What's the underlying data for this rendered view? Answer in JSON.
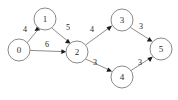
{
  "figure": {
    "type": "directed-weighted-graph",
    "background_color": "#ffffff",
    "node_fill_color": "#ffffff",
    "node_stroke_color": "#8a8a8a",
    "edge_color": "#8d8d8d",
    "arrow_color": "#1a1a1a",
    "label_color": "#2b2b2b"
  },
  "graph": {
    "nodes": [
      {
        "id": "0",
        "label": "0",
        "cx": 19,
        "cy": 50,
        "r": 11
      },
      {
        "id": "1",
        "label": "1",
        "cx": 45,
        "cy": 19,
        "r": 11
      },
      {
        "id": "2",
        "label": "2",
        "cx": 77,
        "cy": 52,
        "r": 11
      },
      {
        "id": "3",
        "label": "3",
        "cx": 122,
        "cy": 20,
        "r": 11
      },
      {
        "id": "4",
        "label": "4",
        "cx": 122,
        "cy": 77,
        "r": 11
      },
      {
        "id": "5",
        "label": "5",
        "cx": 161,
        "cy": 49,
        "r": 11
      }
    ],
    "edges": [
      {
        "id": "e0-1",
        "from": "0",
        "to": "1",
        "weight": "4",
        "label_x": 25,
        "label_y": 29
      },
      {
        "id": "e0-2",
        "from": "0",
        "to": "2",
        "weight": "6",
        "label_x": 47,
        "label_y": 44
      },
      {
        "id": "e1-2",
        "from": "1",
        "to": "2",
        "weight": "5",
        "label_x": 68,
        "label_y": 27
      },
      {
        "id": "e2-3",
        "from": "2",
        "to": "3",
        "weight": "4",
        "label_x": 92,
        "label_y": 29
      },
      {
        "id": "e2-4",
        "from": "2",
        "to": "4",
        "weight": "3",
        "label_x": 95,
        "label_y": 62
      },
      {
        "id": "e3-5",
        "from": "3",
        "to": "5",
        "weight": "3",
        "label_x": 141,
        "label_y": 26
      },
      {
        "id": "e4-5",
        "from": "4",
        "to": "5",
        "weight": "3",
        "label_x": 140,
        "label_y": 62
      }
    ]
  }
}
